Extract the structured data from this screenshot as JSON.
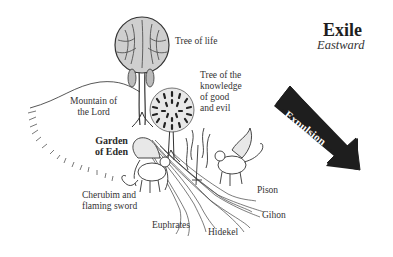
{
  "header": {
    "title": "Exile",
    "subtitle": "Eastward"
  },
  "arrow": {
    "label": "Expulsion",
    "color": "#1e1e1e"
  },
  "labels": {
    "tree_of_life": "Tree of life",
    "tree_of_knowledge": [
      "Tree of the",
      "knowledge",
      "of good",
      "and evil"
    ],
    "mountain": [
      "Mountain of",
      "the Lord"
    ],
    "garden": [
      "Garden",
      "of Eden"
    ],
    "cherubim": [
      "Cherubim and",
      "flaming sword"
    ],
    "rivers": {
      "pison": "Pison",
      "gihon": "Gihon",
      "hidekel": "Hidekel",
      "euphrates": "Euphrates"
    }
  }
}
